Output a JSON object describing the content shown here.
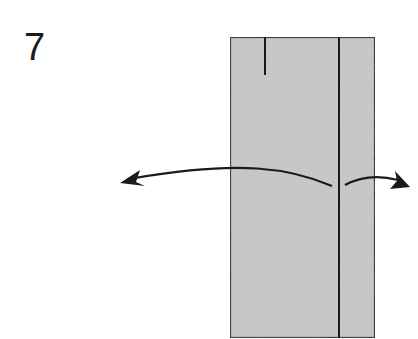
{
  "step": {
    "number": "7"
  },
  "diagram": {
    "paper_color": "#c8c8c8",
    "line_color": "#1a1a1a",
    "icons": [
      "curved-arrow-left",
      "curved-arrow-right"
    ]
  }
}
